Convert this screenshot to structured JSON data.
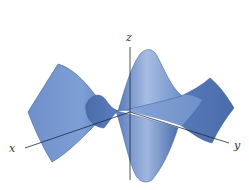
{
  "figure": {
    "type": "3d-surface-plot",
    "colors": {
      "surface_light": "#8fabdc",
      "surface_mid": "#6f90c9",
      "surface_dark": "#4a6cab",
      "surface_edge": "#3c5c98",
      "axis": "#1a2a40",
      "background": "#ffffff"
    },
    "axes": {
      "x_label": "x",
      "y_label": "y",
      "z_label": "z"
    }
  }
}
